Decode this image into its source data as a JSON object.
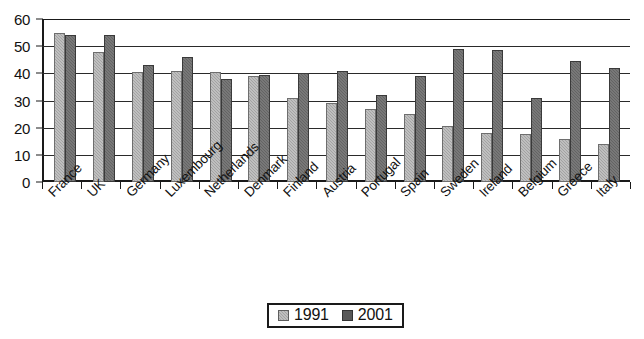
{
  "chart_data": {
    "type": "bar",
    "title": "",
    "subtitle": "",
    "xlabel": "",
    "ylabel": "",
    "ylim": [
      0,
      60
    ],
    "yticks": [
      0,
      10,
      20,
      30,
      40,
      50,
      60
    ],
    "ytick_labels": [
      "0",
      "10",
      "20",
      "30",
      "40",
      "50",
      "60"
    ],
    "grid": true,
    "grid_axis": "y",
    "legend_position": "bottom-center",
    "orientation": "vertical",
    "categories": [
      "France",
      "UK",
      "Germany",
      "Luxembourg",
      "Netherlands",
      "Denmark",
      "Finland",
      "Austria",
      "Portugal",
      "Spain",
      "Sweden",
      "Ireland",
      "Belgium",
      "Greece",
      "Italy"
    ],
    "series": [
      {
        "name": "1991",
        "color": "#a3a3a3",
        "values": [
          55,
          48,
          40.5,
          41,
          40.5,
          39,
          31,
          29,
          27,
          25,
          20.5,
          18,
          17.5,
          16,
          14
        ]
      },
      {
        "name": "2001",
        "color": "#646464",
        "values": [
          54,
          54,
          43,
          46,
          38,
          39.5,
          40,
          41,
          32,
          39,
          49,
          48.5,
          31,
          44.5,
          42
        ]
      }
    ]
  },
  "legend": {
    "entries": [
      {
        "label": "1991"
      },
      {
        "label": "2001"
      }
    ]
  },
  "colors": {
    "series_1991": "#a3a3a3",
    "series_2001": "#646464",
    "axis": "#1a1a1a",
    "gridline": "#2a2a2a",
    "background": "#ffffff"
  }
}
